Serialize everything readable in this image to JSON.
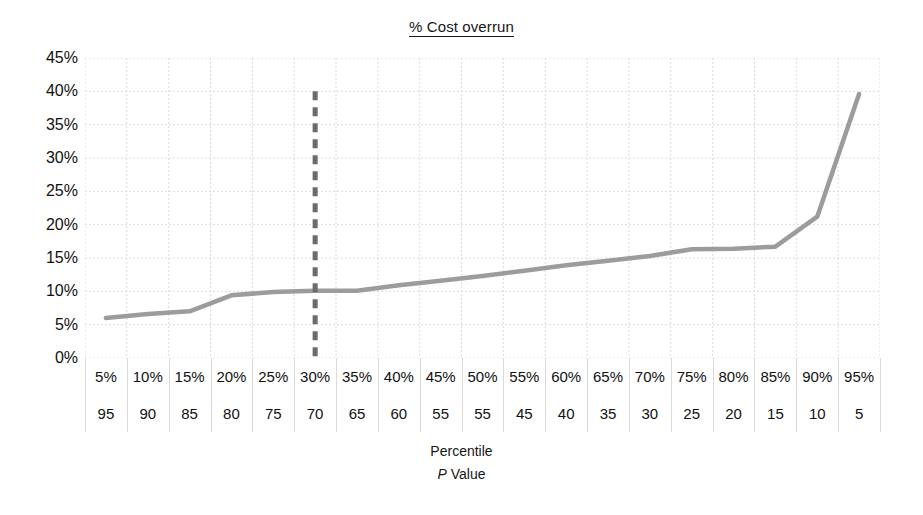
{
  "chart_data": {
    "type": "line",
    "title": "% Cost overrun",
    "xlabel": "Percentile",
    "xlabel2": "P Value",
    "xlabel2_italic_prefix": "P",
    "xlabel2_rest": " Value",
    "ylabel": "",
    "ylim": [
      0,
      45
    ],
    "grid": true,
    "legend": "none",
    "y_ticks": [
      "0%",
      "5%",
      "10%",
      "15%",
      "20%",
      "25%",
      "30%",
      "35%",
      "40%",
      "45%"
    ],
    "y_tick_values": [
      0,
      5,
      10,
      15,
      20,
      25,
      30,
      35,
      40,
      45
    ],
    "categories": [
      "5%",
      "10%",
      "15%",
      "20%",
      "25%",
      "30%",
      "35%",
      "40%",
      "45%",
      "50%",
      "55%",
      "60%",
      "65%",
      "70%",
      "75%",
      "80%",
      "85%",
      "90%",
      "95%"
    ],
    "p_values": [
      "95",
      "90",
      "85",
      "80",
      "75",
      "70",
      "65",
      "60",
      "55",
      "55",
      "45",
      "40",
      "35",
      "30",
      "25",
      "20",
      "15",
      "10",
      "5"
    ],
    "series": [
      {
        "name": "% Cost overrun",
        "color": "#9c9c9c",
        "values": [
          6.0,
          6.6,
          7.0,
          9.4,
          9.9,
          10.1,
          10.1,
          10.9,
          11.6,
          12.3,
          13.1,
          13.9,
          14.6,
          15.3,
          16.3,
          16.4,
          16.7,
          21.2,
          39.6
        ]
      }
    ],
    "annotations": [
      {
        "name": "p-threshold-line",
        "type": "vertical-dashed-line",
        "at_category": "30%",
        "at_p_value": "70",
        "y_from": 0,
        "y_to": 40,
        "color": "#6b6b6b"
      }
    ],
    "colors": {
      "series": "#9c9c9c",
      "grid": "#dcdcdc",
      "dashed_marker": "#6b6b6b",
      "text": "#161616",
      "background": "#ffffff"
    }
  }
}
